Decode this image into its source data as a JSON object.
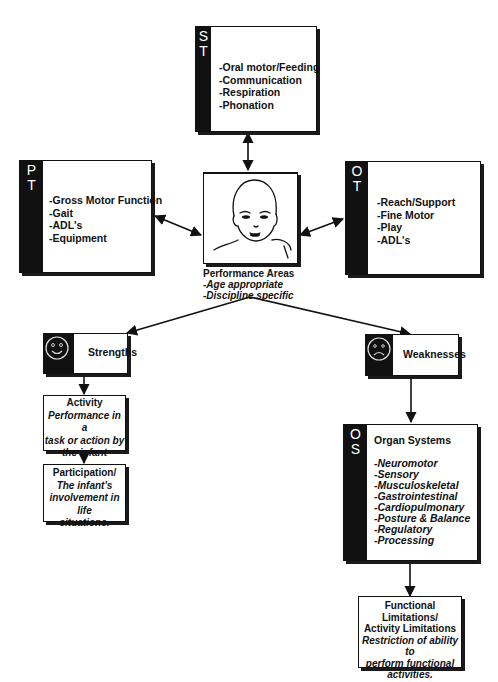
{
  "header_fragment": "",
  "st_box": {
    "band_letters": [
      "S",
      "T"
    ],
    "items": [
      "-Oral motor/Feeding",
      "-Communication",
      "-Respiration",
      "-Phonation"
    ]
  },
  "pt_box": {
    "band_letters": [
      "P",
      "T"
    ],
    "items": [
      "-Gross Motor Function",
      "-Gait",
      "-ADL's",
      "-Equipment"
    ]
  },
  "ot_box": {
    "band_letters": [
      "O",
      "T"
    ],
    "items": [
      "-Reach/Support",
      "-Fine Motor",
      "-Play",
      "-ADL's"
    ]
  },
  "center": {
    "image": "infant-face-drawing",
    "title": "Performance Areas",
    "lines": [
      "-Age appropriate",
      "-Discipline specific"
    ]
  },
  "strengths": {
    "icon": "smiley-face-icon",
    "label": "Strengths"
  },
  "weaknesses": {
    "icon": "frowning-face-icon",
    "label": "Weaknesses"
  },
  "activity": {
    "title": "Activity",
    "desc": [
      "Performance in a",
      "task or action by",
      "the infant"
    ]
  },
  "participation": {
    "title": "Participation/",
    "desc": [
      "The infant's",
      "involvement in life",
      "situations."
    ]
  },
  "os_box": {
    "band_letters": [
      "O",
      "S"
    ],
    "title": "Organ Systems",
    "items": [
      "-Neuromotor",
      "-Sensory",
      "-Musculoskeletal",
      "-Gastrointestinal",
      "-Cardiopulmonary",
      "-Posture & Balance",
      "-Regulatory",
      "-Processing"
    ]
  },
  "functional": {
    "title": [
      "Functional Limitations/",
      "Activity Limitations"
    ],
    "desc": [
      "Restriction of ability to",
      "perform functional",
      "activities."
    ]
  },
  "colors": {
    "ink": "#111111",
    "background": "#ffffff"
  }
}
